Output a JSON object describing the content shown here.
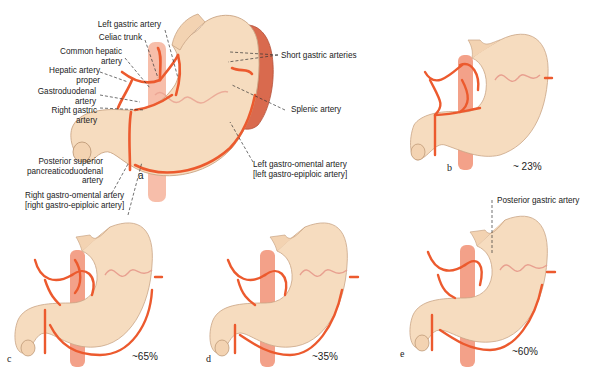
{
  "figure": {
    "colors": {
      "stomach_fill": "#f6dcbf",
      "stomach_edge": "#c9a585",
      "artery": "#ec5a2e",
      "spleen": "#d96a4e",
      "aorta": "#f08a6c",
      "text": "#222222"
    },
    "panels": [
      {
        "id": "a",
        "letter": "a",
        "labels": {
          "left_gastric": "Left gastric artery",
          "celiac_trunk": "Celiac trunk",
          "common_hepatic_1": "Common hepatic",
          "common_hepatic_2": "artery",
          "hepatic_proper_1": "Hepatic artery",
          "hepatic_proper_2": "proper",
          "gastroduodenal_1": "Gastroduodenal",
          "gastroduodenal_2": "artery",
          "right_gastric_1": "Right gastric",
          "right_gastric_2": "artery",
          "psp_1": "Posterior superior",
          "psp_2": "pancreaticoduodenal",
          "psp_3": "artery",
          "rgo_1": "Right gastro-omental artery",
          "rgo_2": "[right gastro-epiploic artery]",
          "short_gastric": "Short gastric arteries",
          "splenic": "Splenic artery",
          "lgo_1": "Left gastro-omental artery",
          "lgo_2": "[left gastro-epiploic artery]"
        }
      },
      {
        "id": "b",
        "letter": "b",
        "percent": "~ 23%"
      },
      {
        "id": "c",
        "letter": "c",
        "percent": "~65%"
      },
      {
        "id": "d",
        "letter": "d",
        "percent": "~35%"
      },
      {
        "id": "e",
        "letter": "e",
        "percent": "~60%",
        "labels": {
          "posterior_gastric": "Posterior gastric artery"
        }
      }
    ]
  }
}
